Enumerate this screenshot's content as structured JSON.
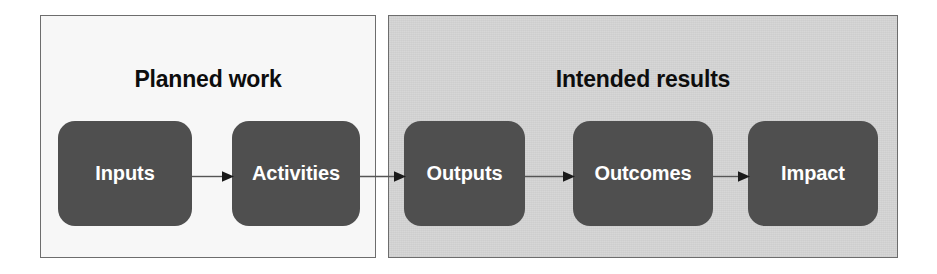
{
  "diagram": {
    "type": "logic-model-flow",
    "panels": [
      {
        "key": "planned",
        "title": "Planned work",
        "background_color": "#f7f7f7",
        "border_color": "#6d6d6d",
        "nodes": [
          {
            "key": "inputs",
            "label": "Inputs"
          },
          {
            "key": "activities",
            "label": "Activities"
          }
        ]
      },
      {
        "key": "intended",
        "title": "Intended results",
        "background_color": "#d5d5d5",
        "border_color": "#6d6d6d",
        "nodes": [
          {
            "key": "outputs",
            "label": "Outputs"
          },
          {
            "key": "outcomes",
            "label": "Outcomes"
          },
          {
            "key": "impact",
            "label": "Impact"
          }
        ]
      }
    ],
    "node_style": {
      "fill_color": "#4f4f4f",
      "text_color": "#ffffff"
    },
    "arrows": [
      {
        "key": "inputs-to-activities",
        "from": "Inputs",
        "to": "Activities"
      },
      {
        "key": "activities-to-outputs",
        "from": "Activities",
        "to": "Outputs"
      },
      {
        "key": "outputs-to-outcomes",
        "from": "Outputs",
        "to": "Outcomes"
      },
      {
        "key": "outcomes-to-impact",
        "from": "Outcomes",
        "to": "Impact"
      }
    ],
    "arrow_color": "#555555"
  }
}
